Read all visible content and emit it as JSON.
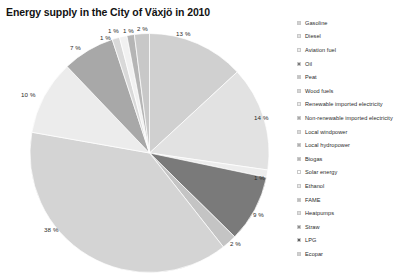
{
  "chart_data": {
    "type": "pie",
    "title": "Energy supply in the City of Växjö in 2010",
    "legend_position": "right",
    "grid": false,
    "value_unit": "%",
    "categories": [
      "Gasoline",
      "Diesel",
      "Aviation fuel",
      "Oil",
      "Peat",
      "Wood fuels",
      "Renewable imported electricity",
      "Non-renewable imported electricity",
      "Local windpower",
      "Local hydropower",
      "Biogas",
      "Solar energy",
      "Ethanol",
      "FAME",
      "Heatpumps",
      "Straw",
      "LPG",
      "Ecopar"
    ],
    "values": [
      13,
      14,
      1,
      9,
      2,
      38,
      10,
      7,
      1,
      1,
      1,
      2,
      0,
      0,
      0,
      0,
      0,
      0
    ],
    "labels": [
      "13 %",
      "14 %",
      "1 %",
      "9 %",
      "2 %",
      "38 %",
      "10 %",
      "7 %",
      "1 %",
      "1 %",
      "1 %",
      "2 %",
      "",
      "",
      "",
      "",
      "",
      ""
    ],
    "colors": [
      "#d0d0d0",
      "#e2e2e2",
      "#ededed",
      "#7a7a7a",
      "#c4c4c4",
      "#d4d4d4",
      "#ececec",
      "#a8a8a8",
      "#d9d9d9",
      "#f1f1f1",
      "#b5b5b5",
      "#c8c8c8",
      "#e8e8e8",
      "#bdbdbd",
      "#dcdcdc",
      "#8e8e8e",
      "#5f5f5f",
      "#cfcfcf"
    ],
    "xlabel": "",
    "ylabel": ""
  },
  "legend": {
    "items": [
      {
        "label": "Gasoline",
        "color": "#d0d0d0"
      },
      {
        "label": "Diesel",
        "color": "#e2e2e2"
      },
      {
        "label": "Aviation fuel",
        "color": "#ededed"
      },
      {
        "label": "Oil",
        "color": "#7a7a7a"
      },
      {
        "label": "Peat",
        "color": "#c4c4c4"
      },
      {
        "label": "Wood fuels",
        "color": "#d4d4d4"
      },
      {
        "label": "Renewable imported electricity",
        "color": "#ececec"
      },
      {
        "label": "Non-renewable imported electricity",
        "color": "#a8a8a8"
      },
      {
        "label": "Local windpower",
        "color": "#d9d9d9"
      },
      {
        "label": "Local hydropower",
        "color": "#b0b0b0"
      },
      {
        "label": "Biogas",
        "color": "#b5b5b5"
      },
      {
        "label": "Solar energy",
        "color": "#ffffff"
      },
      {
        "label": "Ethanol",
        "color": "#e8e8e8"
      },
      {
        "label": "FAME",
        "color": "#bdbdbd"
      },
      {
        "label": "Heatpumps",
        "color": "#dcdcdc"
      },
      {
        "label": "Straw",
        "color": "#8e8e8e"
      },
      {
        "label": "LPG",
        "color": "#5f5f5f"
      },
      {
        "label": "Ecopar",
        "color": "#cfcfcf"
      }
    ]
  },
  "pie_labels": [
    {
      "text": "13 %",
      "x": 176,
      "y": 30
    },
    {
      "text": "14 %",
      "x": 254,
      "y": 114
    },
    {
      "text": "1 %",
      "x": 254,
      "y": 174
    },
    {
      "text": "9 %",
      "x": 253,
      "y": 211
    },
    {
      "text": "2 %",
      "x": 230,
      "y": 240
    },
    {
      "text": "38 %",
      "x": 44,
      "y": 226
    },
    {
      "text": "10 %",
      "x": 21,
      "y": 91
    },
    {
      "text": "7 %",
      "x": 70,
      "y": 44
    },
    {
      "text": "1 %",
      "x": 100,
      "y": 34
    },
    {
      "text": "1 %",
      "x": 108,
      "y": 27
    },
    {
      "text": "1 %",
      "x": 123,
      "y": 27
    },
    {
      "text": "2 %",
      "x": 137,
      "y": 25
    }
  ]
}
